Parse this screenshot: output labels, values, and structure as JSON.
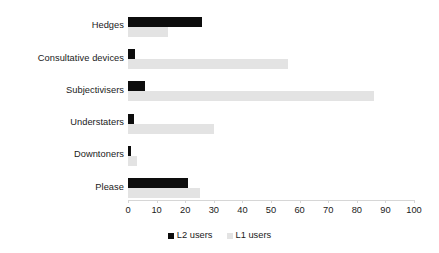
{
  "chart_data": {
    "type": "bar",
    "orientation": "horizontal",
    "title": "",
    "xlabel": "",
    "ylabel": "",
    "xlim": [
      0,
      100
    ],
    "xticks": [
      0,
      10,
      20,
      30,
      40,
      50,
      60,
      70,
      80,
      90,
      100
    ],
    "grid": false,
    "legend_position": "bottom-center",
    "categories": [
      "Hedges",
      "Consultative devices",
      "Subjectivisers",
      "Understaters",
      "Downtoners",
      "Please"
    ],
    "series": [
      {
        "name": "L2 users",
        "color": "#0d0d0d",
        "values": [
          26,
          2.5,
          6,
          2,
          1,
          21
        ]
      },
      {
        "name": "L1 users",
        "color": "#e3e3e3",
        "values": [
          14,
          56,
          86,
          30,
          3,
          25
        ]
      }
    ]
  },
  "axis": {
    "tick_labels": [
      "0",
      "10",
      "20",
      "30",
      "40",
      "50",
      "60",
      "70",
      "80",
      "90",
      "100"
    ]
  },
  "legend": {
    "items": [
      {
        "label": "L2 users",
        "color": "#0d0d0d"
      },
      {
        "label": "L1 users",
        "color": "#e3e3e3"
      }
    ]
  },
  "colors": {
    "l2": "#0d0d0d",
    "l1": "#e3e3e3",
    "axis": "#d6d6d6",
    "text": "#1a1a1a",
    "background": "#ffffff"
  }
}
